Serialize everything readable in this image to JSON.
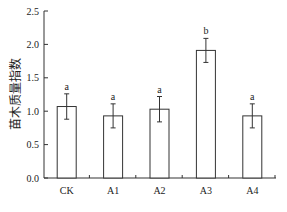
{
  "chart_data": {
    "type": "bar",
    "title": "",
    "xlabel": "",
    "ylabel": "苗木质量指数",
    "categories": [
      "CK",
      "A1",
      "A2",
      "A3",
      "A4"
    ],
    "values": [
      1.07,
      0.93,
      1.03,
      1.91,
      0.93
    ],
    "errors": [
      0.19,
      0.18,
      0.19,
      0.18,
      0.18
    ],
    "significance_letters": [
      "a",
      "a",
      "a",
      "b",
      "a"
    ],
    "ylim": [
      0,
      2.5
    ],
    "yticks": [
      0.0,
      0.5,
      1.0,
      1.5,
      2.0,
      2.5
    ],
    "ytick_labels": [
      "0.0",
      "0.5",
      "1.0",
      "1.5",
      "2.0",
      "2.5"
    ],
    "grid": false,
    "legend": null,
    "bar_fill": "#ffffff",
    "bar_edge": "#333333"
  }
}
